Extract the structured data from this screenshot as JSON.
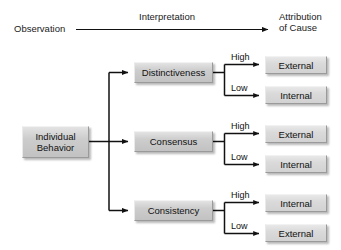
{
  "diagram": {
    "title_row": {
      "observation": "Observation",
      "interpretation": "Interpretation",
      "attribution_line1": "Attribution",
      "attribution_line2": "of Cause"
    },
    "root": {
      "line1": "Individual",
      "line2": "Behavior"
    },
    "branch_labels": {
      "high": "High",
      "low": "Low"
    },
    "criteria": [
      {
        "label": "Distinctiveness",
        "high_outcome": "External",
        "low_outcome": "Internal"
      },
      {
        "label": "Consensus",
        "high_outcome": "External",
        "low_outcome": "Internal"
      },
      {
        "label": "Consistency",
        "high_outcome": "Internal",
        "low_outcome": "External"
      }
    ],
    "colors": {
      "background": "#ffffff",
      "box_fill_dark": "#c8c8c8",
      "box_fill_light": "#d8d8d8",
      "line": "#111111",
      "text": "#111111"
    }
  }
}
